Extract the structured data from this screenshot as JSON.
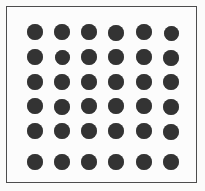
{
  "figure": {
    "canvas": {
      "width": 205,
      "height": 191,
      "outer_background": "#fbfbfa",
      "inner_background": "#fcfcfc"
    },
    "frame": {
      "x": 6,
      "y": 6,
      "width": 191,
      "height": 177,
      "stroke_color": "#4d4d4d",
      "stroke_width": 1.4
    }
  },
  "chart_data": {
    "type": "scatter",
    "subtitle": "",
    "xlabel": "",
    "ylabel": "",
    "grid": false,
    "legend": null,
    "n_rows": 6,
    "n_cols": 6,
    "n_points": 36,
    "marker": {
      "shape": "circle",
      "filled": true,
      "color": "#333333",
      "diameter_px": 16
    },
    "xlim": [
      0,
      205
    ],
    "ylim": [
      0,
      191
    ],
    "col_pitch_px": 27,
    "row_pitch_px": 25,
    "x_centers": [
      35,
      62,
      89,
      116,
      144,
      171
    ],
    "y_centers": [
      32,
      57,
      82,
      106,
      131,
      162
    ],
    "points": [
      {
        "col": 1,
        "row": 1,
        "cx": 35,
        "cy": 32,
        "d": 16
      },
      {
        "col": 2,
        "row": 1,
        "cx": 62,
        "cy": 32,
        "d": 16
      },
      {
        "col": 3,
        "row": 1,
        "cx": 89,
        "cy": 32,
        "d": 16
      },
      {
        "col": 4,
        "row": 1,
        "cx": 116,
        "cy": 33,
        "d": 16
      },
      {
        "col": 5,
        "row": 1,
        "cx": 144,
        "cy": 32,
        "d": 16
      },
      {
        "col": 6,
        "row": 1,
        "cx": 171,
        "cy": 33,
        "d": 15
      },
      {
        "col": 1,
        "row": 2,
        "cx": 35,
        "cy": 57,
        "d": 16
      },
      {
        "col": 2,
        "row": 2,
        "cx": 62,
        "cy": 57,
        "d": 15
      },
      {
        "col": 3,
        "row": 2,
        "cx": 89,
        "cy": 57,
        "d": 16
      },
      {
        "col": 4,
        "row": 2,
        "cx": 116,
        "cy": 57,
        "d": 16
      },
      {
        "col": 5,
        "row": 2,
        "cx": 144,
        "cy": 57,
        "d": 16
      },
      {
        "col": 6,
        "row": 2,
        "cx": 171,
        "cy": 58,
        "d": 16
      },
      {
        "col": 1,
        "row": 3,
        "cx": 35,
        "cy": 82,
        "d": 16
      },
      {
        "col": 2,
        "row": 3,
        "cx": 62,
        "cy": 82,
        "d": 16
      },
      {
        "col": 3,
        "row": 3,
        "cx": 89,
        "cy": 82,
        "d": 16
      },
      {
        "col": 4,
        "row": 3,
        "cx": 116,
        "cy": 82,
        "d": 16
      },
      {
        "col": 5,
        "row": 3,
        "cx": 144,
        "cy": 82,
        "d": 16
      },
      {
        "col": 6,
        "row": 3,
        "cx": 171,
        "cy": 82,
        "d": 16
      },
      {
        "col": 1,
        "row": 4,
        "cx": 35,
        "cy": 106,
        "d": 16
      },
      {
        "col": 2,
        "row": 4,
        "cx": 62,
        "cy": 107,
        "d": 16
      },
      {
        "col": 3,
        "row": 4,
        "cx": 89,
        "cy": 106,
        "d": 16
      },
      {
        "col": 4,
        "row": 4,
        "cx": 116,
        "cy": 106,
        "d": 16
      },
      {
        "col": 5,
        "row": 4,
        "cx": 144,
        "cy": 106,
        "d": 16
      },
      {
        "col": 6,
        "row": 4,
        "cx": 171,
        "cy": 107,
        "d": 16
      },
      {
        "col": 1,
        "row": 5,
        "cx": 35,
        "cy": 131,
        "d": 16
      },
      {
        "col": 2,
        "row": 5,
        "cx": 62,
        "cy": 131,
        "d": 16
      },
      {
        "col": 3,
        "row": 5,
        "cx": 89,
        "cy": 131,
        "d": 16
      },
      {
        "col": 4,
        "row": 5,
        "cx": 116,
        "cy": 131,
        "d": 16
      },
      {
        "col": 5,
        "row": 5,
        "cx": 144,
        "cy": 131,
        "d": 16
      },
      {
        "col": 6,
        "row": 5,
        "cx": 171,
        "cy": 132,
        "d": 16
      },
      {
        "col": 1,
        "row": 6,
        "cx": 35,
        "cy": 162,
        "d": 16
      },
      {
        "col": 2,
        "row": 6,
        "cx": 62,
        "cy": 162,
        "d": 16
      },
      {
        "col": 3,
        "row": 6,
        "cx": 89,
        "cy": 162,
        "d": 16
      },
      {
        "col": 4,
        "row": 6,
        "cx": 116,
        "cy": 162,
        "d": 16
      },
      {
        "col": 5,
        "row": 6,
        "cx": 144,
        "cy": 162,
        "d": 16
      },
      {
        "col": 6,
        "row": 6,
        "cx": 171,
        "cy": 162,
        "d": 16
      }
    ]
  }
}
